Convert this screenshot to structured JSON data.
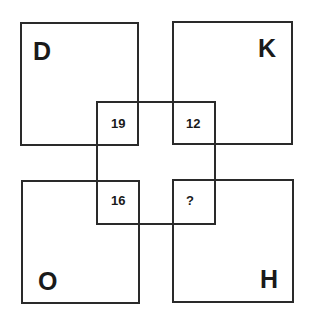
{
  "puzzle": {
    "type": "overlapping-squares-number-letter",
    "corners": [
      {
        "position": "top-left",
        "letter": "D",
        "value": "19"
      },
      {
        "position": "top-right",
        "letter": "K",
        "value": "12"
      },
      {
        "position": "bottom-left",
        "letter": "O",
        "value": "16"
      },
      {
        "position": "bottom-right",
        "letter": "H",
        "value": "?"
      }
    ],
    "colors": {
      "line": "#2a2a2a",
      "text": "#1a1a1a",
      "background": "#ffffff"
    }
  }
}
